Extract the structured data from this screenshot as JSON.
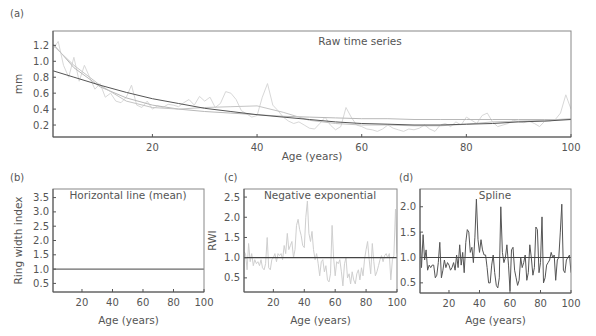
{
  "chart_data": [
    {
      "panel": "(a)",
      "type": "line",
      "title": "Raw time series",
      "xlabel": "Age (years)",
      "ylabel": "mm",
      "xlim": [
        1,
        100
      ],
      "ylim": [
        0.05,
        1.38
      ],
      "xticks": [
        20,
        40,
        60,
        80,
        100
      ],
      "yticks": [
        0.2,
        0.4,
        0.6,
        0.8,
        1.0,
        1.2
      ],
      "ytick_labels": [
        "0.2",
        "0.4",
        "0.6",
        "0.8",
        "1.0",
        "1.2"
      ],
      "grid": false,
      "series": [
        {
          "name": "raw ring widths",
          "color": "#d8d8d8",
          "x": [
            1,
            2,
            3,
            4,
            5,
            6,
            7,
            8,
            9,
            10,
            11,
            12,
            13,
            14,
            15,
            16,
            17,
            18,
            19,
            20,
            21,
            22,
            23,
            24,
            25,
            26,
            27,
            28,
            29,
            30,
            31,
            32,
            33,
            34,
            35,
            36,
            37,
            38,
            39,
            40,
            41,
            42,
            43,
            44,
            45,
            46,
            47,
            48,
            49,
            50,
            51,
            52,
            53,
            54,
            55,
            56,
            57,
            58,
            59,
            60,
            61,
            62,
            63,
            64,
            65,
            66,
            67,
            68,
            69,
            70,
            71,
            72,
            73,
            74,
            75,
            76,
            77,
            78,
            79,
            80,
            81,
            82,
            83,
            84,
            85,
            86,
            87,
            88,
            89,
            90,
            91,
            92,
            93,
            94,
            95,
            96,
            97,
            98,
            99,
            100
          ],
          "values": [
            1.15,
            1.25,
            0.95,
            0.8,
            1.05,
            0.75,
            0.95,
            0.8,
            0.65,
            0.72,
            0.55,
            0.6,
            0.5,
            0.48,
            0.55,
            0.7,
            0.45,
            0.42,
            0.5,
            0.4,
            0.44,
            0.42,
            0.46,
            0.45,
            0.43,
            0.48,
            0.52,
            0.45,
            0.56,
            0.5,
            0.55,
            0.42,
            0.47,
            0.62,
            0.6,
            0.52,
            0.38,
            0.34,
            0.3,
            0.32,
            0.55,
            0.72,
            0.45,
            0.38,
            0.3,
            0.25,
            0.22,
            0.24,
            0.2,
            0.16,
            0.15,
            0.22,
            0.3,
            0.2,
            0.14,
            0.18,
            0.42,
            0.3,
            0.2,
            0.18,
            0.15,
            0.14,
            0.12,
            0.15,
            0.2,
            0.16,
            0.14,
            0.12,
            0.15,
            0.14,
            0.16,
            0.2,
            0.15,
            0.12,
            0.2,
            0.22,
            0.18,
            0.24,
            0.2,
            0.3,
            0.26,
            0.22,
            0.32,
            0.35,
            0.24,
            0.18,
            0.2,
            0.22,
            0.26,
            0.24,
            0.23,
            0.25,
            0.22,
            0.18,
            0.25,
            0.25,
            0.27,
            0.35,
            0.58,
            0.4
          ]
        },
        {
          "name": "negative exponential fit",
          "color": "#b8b8b8",
          "x": [
            1,
            5,
            10,
            15,
            20,
            25,
            30,
            35,
            40,
            45,
            50,
            55,
            60,
            65,
            70,
            75,
            80,
            85,
            90,
            95,
            100
          ],
          "values": [
            1.22,
            0.92,
            0.68,
            0.54,
            0.45,
            0.4,
            0.37,
            0.35,
            0.33,
            0.31,
            0.3,
            0.29,
            0.28,
            0.28,
            0.27,
            0.27,
            0.27,
            0.27,
            0.27,
            0.27,
            0.27
          ]
        },
        {
          "name": "spline fit",
          "color": "#c4c4c4",
          "x": [
            1,
            5,
            10,
            15,
            20,
            25,
            30,
            35,
            40,
            45,
            50,
            55,
            60,
            65,
            70,
            75,
            80,
            85,
            90,
            95,
            100
          ],
          "values": [
            1.2,
            0.95,
            0.7,
            0.5,
            0.42,
            0.4,
            0.42,
            0.43,
            0.44,
            0.36,
            0.26,
            0.22,
            0.2,
            0.2,
            0.19,
            0.19,
            0.21,
            0.24,
            0.25,
            0.26,
            0.28
          ]
        },
        {
          "name": "mean / long curve",
          "color": "#555555",
          "x": [
            1,
            5,
            10,
            15,
            20,
            25,
            30,
            35,
            40,
            45,
            50,
            55,
            60,
            65,
            70,
            75,
            80,
            85,
            90,
            95,
            100
          ],
          "values": [
            0.88,
            0.8,
            0.7,
            0.61,
            0.53,
            0.47,
            0.41,
            0.37,
            0.33,
            0.3,
            0.27,
            0.24,
            0.22,
            0.21,
            0.2,
            0.2,
            0.21,
            0.22,
            0.24,
            0.25,
            0.27
          ]
        }
      ]
    },
    {
      "panel": "(b)",
      "type": "line",
      "title": "Horizontal line (mean)",
      "xlabel": "Age (years)",
      "ylabel": "Ring width index",
      "xlim": [
        1,
        100
      ],
      "ylim": [
        0.2,
        3.8
      ],
      "xticks": [
        20,
        40,
        60,
        80,
        100
      ],
      "yticks": [
        0.5,
        1.0,
        1.5,
        2.0,
        2.5,
        3.0,
        3.5
      ],
      "ytick_labels": [
        "0.5",
        "1.0",
        "1.5",
        "2.0",
        "2.5",
        "3.0",
        "3.5"
      ],
      "grid": false,
      "series": [
        {
          "name": "index",
          "color": "#444444",
          "x": [
            1,
            100
          ],
          "values": [
            1.0,
            1.0
          ]
        }
      ]
    },
    {
      "panel": "(c)",
      "type": "line",
      "title": "Negative exponential",
      "xlabel": "Age (years)",
      "ylabel": "RWI",
      "xlim": [
        1,
        100
      ],
      "ylim": [
        0.15,
        2.7
      ],
      "xticks": [
        20,
        40,
        60,
        80,
        100
      ],
      "yticks": [
        0.5,
        1.0,
        1.5,
        2.0,
        2.5
      ],
      "ytick_labels": [
        "0.5",
        "1.0",
        "1.5",
        "2.0",
        "2.5"
      ],
      "grid": false,
      "reference_line": 1.0,
      "series": [
        {
          "name": "RWI (negative exponential)",
          "color": "#cfcfcf",
          "x": [
            1,
            2,
            3,
            4,
            5,
            6,
            7,
            8,
            9,
            10,
            11,
            12,
            13,
            14,
            15,
            16,
            17,
            18,
            19,
            20,
            21,
            22,
            23,
            24,
            25,
            26,
            27,
            28,
            29,
            30,
            31,
            32,
            33,
            34,
            35,
            36,
            37,
            38,
            39,
            40,
            41,
            42,
            43,
            44,
            45,
            46,
            47,
            48,
            49,
            50,
            51,
            52,
            53,
            54,
            55,
            56,
            57,
            58,
            59,
            60,
            61,
            62,
            63,
            64,
            65,
            66,
            67,
            68,
            69,
            70,
            71,
            72,
            73,
            74,
            75,
            76,
            77,
            78,
            79,
            80,
            81,
            82,
            83,
            84,
            85,
            86,
            87,
            88,
            89,
            90,
            91,
            92,
            93,
            94,
            95,
            96,
            97,
            98,
            99,
            100
          ],
          "values": [
            1.15,
            1.1,
            0.7,
            1.35,
            0.9,
            1.1,
            0.8,
            0.95,
            0.85,
            0.9,
            0.8,
            0.95,
            0.75,
            0.7,
            0.85,
            1.5,
            0.75,
            0.7,
            0.95,
            1.0,
            1.1,
            0.9,
            1.1,
            1.05,
            1.1,
            0.95,
            1.3,
            1.1,
            1.6,
            1.2,
            1.3,
            1.4,
            1.0,
            1.2,
            1.8,
            1.95,
            1.7,
            1.55,
            1.3,
            1.25,
            2.0,
            2.4,
            1.6,
            1.4,
            1.65,
            1.2,
            0.95,
            1.1,
            0.85,
            0.55,
            0.9,
            0.95,
            0.65,
            0.8,
            0.45,
            0.4,
            0.6,
            1.8,
            1.0,
            0.55,
            0.9,
            0.85,
            0.95,
            0.65,
            0.3,
            0.85,
            1.0,
            0.5,
            0.6,
            0.35,
            0.65,
            0.45,
            0.35,
            0.6,
            0.7,
            0.45,
            0.75,
            0.55,
            0.95,
            1.2,
            1.4,
            0.95,
            0.6,
            1.35,
            0.9,
            0.55,
            0.65,
            0.8,
            0.95,
            1.05,
            0.9,
            1.05,
            1.1,
            1.0,
            1.1,
            0.45,
            0.95,
            1.05,
            2.2,
            1.1
          ]
        }
      ]
    },
    {
      "panel": "(d)",
      "type": "line",
      "title": "Spline",
      "xlabel": "Age (years)",
      "ylabel": "",
      "xlim": [
        1,
        100
      ],
      "ylim": [
        0.3,
        2.35
      ],
      "xticks": [
        20,
        40,
        60,
        80,
        100
      ],
      "yticks": [
        0.5,
        1.0,
        1.5,
        2.0
      ],
      "ytick_labels": [
        "0.5",
        "1.0",
        "1.5",
        "2.0"
      ],
      "grid": false,
      "reference_line": 1.0,
      "series": [
        {
          "name": "RWI (spline)",
          "color": "#555555",
          "x": [
            1,
            2,
            3,
            4,
            5,
            6,
            7,
            8,
            9,
            10,
            11,
            12,
            13,
            14,
            15,
            16,
            17,
            18,
            19,
            20,
            21,
            22,
            23,
            24,
            25,
            26,
            27,
            28,
            29,
            30,
            31,
            32,
            33,
            34,
            35,
            36,
            37,
            38,
            39,
            40,
            41,
            42,
            43,
            44,
            45,
            46,
            47,
            48,
            49,
            50,
            51,
            52,
            53,
            54,
            55,
            56,
            57,
            58,
            59,
            60,
            61,
            62,
            63,
            64,
            65,
            66,
            67,
            68,
            69,
            70,
            71,
            72,
            73,
            74,
            75,
            76,
            77,
            78,
            79,
            80,
            81,
            82,
            83,
            84,
            85,
            86,
            87,
            88,
            89,
            90,
            91,
            92,
            93,
            94,
            95,
            96,
            97,
            98,
            99,
            100
          ],
          "values": [
            1.5,
            0.8,
            1.45,
            0.95,
            1.15,
            0.75,
            0.85,
            0.8,
            0.85,
            0.85,
            0.6,
            0.65,
            0.9,
            1.3,
            0.6,
            0.75,
            0.95,
            0.8,
            0.9,
            0.85,
            0.75,
            0.8,
            0.9,
            0.75,
            1.05,
            0.8,
            1.25,
            0.85,
            1.1,
            0.7,
            1.3,
            1.55,
            1.5,
            1.1,
            1.2,
            0.9,
            1.4,
            2.15,
            1.35,
            1.1,
            1.35,
            1.15,
            1.05,
            1.05,
            0.8,
            0.5,
            0.5,
            0.85,
            1.05,
            0.7,
            0.45,
            0.4,
            0.6,
            2.0,
            1.1,
            0.9,
            1.0,
            1.25,
            0.85,
            0.35,
            1.15,
            1.2,
            0.75,
            0.6,
            0.45,
            0.55,
            1.0,
            0.8,
            0.9,
            1.05,
            0.55,
            0.7,
            1.25,
            1.0,
            0.65,
            0.8,
            1.6,
            1.55,
            0.7,
            0.9,
            1.8,
            0.5,
            0.6,
            0.85,
            0.9,
            0.95,
            1.1,
            1.0,
            1.05,
            0.55,
            0.95,
            1.0,
            1.5,
            2.05,
            0.75,
            0.7,
            0.95,
            1.0,
            1.05,
            0.7
          ]
        }
      ]
    }
  ]
}
